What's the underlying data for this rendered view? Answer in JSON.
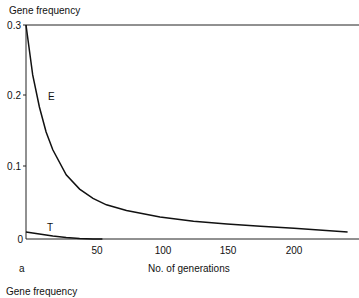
{
  "chart_data": [
    {
      "type": "line",
      "panel_label": "a",
      "ylabel": "Gene frequency",
      "xlabel": "No. of generations",
      "ylim": [
        0,
        0.3
      ],
      "xlim": [
        0,
        245
      ],
      "yticks": [
        "0",
        "0.1",
        "0.2",
        "0.3"
      ],
      "xticks": [
        "50",
        "100",
        "150",
        "200"
      ],
      "grid": false,
      "series": [
        {
          "name": "E",
          "x": [
            0,
            5,
            10,
            15,
            20,
            30,
            40,
            50,
            60,
            75,
            100,
            125,
            150,
            175,
            200,
            240
          ],
          "y": [
            0.3,
            0.23,
            0.185,
            0.15,
            0.125,
            0.09,
            0.07,
            0.057,
            0.048,
            0.04,
            0.031,
            0.025,
            0.021,
            0.018,
            0.015,
            0.01
          ]
        },
        {
          "name": "T",
          "x": [
            0,
            10,
            20,
            30,
            40,
            50,
            57
          ],
          "y": [
            0.01,
            0.007,
            0.004,
            0.002,
            0.0007,
            0.0002,
            0.0
          ]
        }
      ]
    },
    {
      "type": "line",
      "ylabel": "Gene frequency"
    }
  ]
}
